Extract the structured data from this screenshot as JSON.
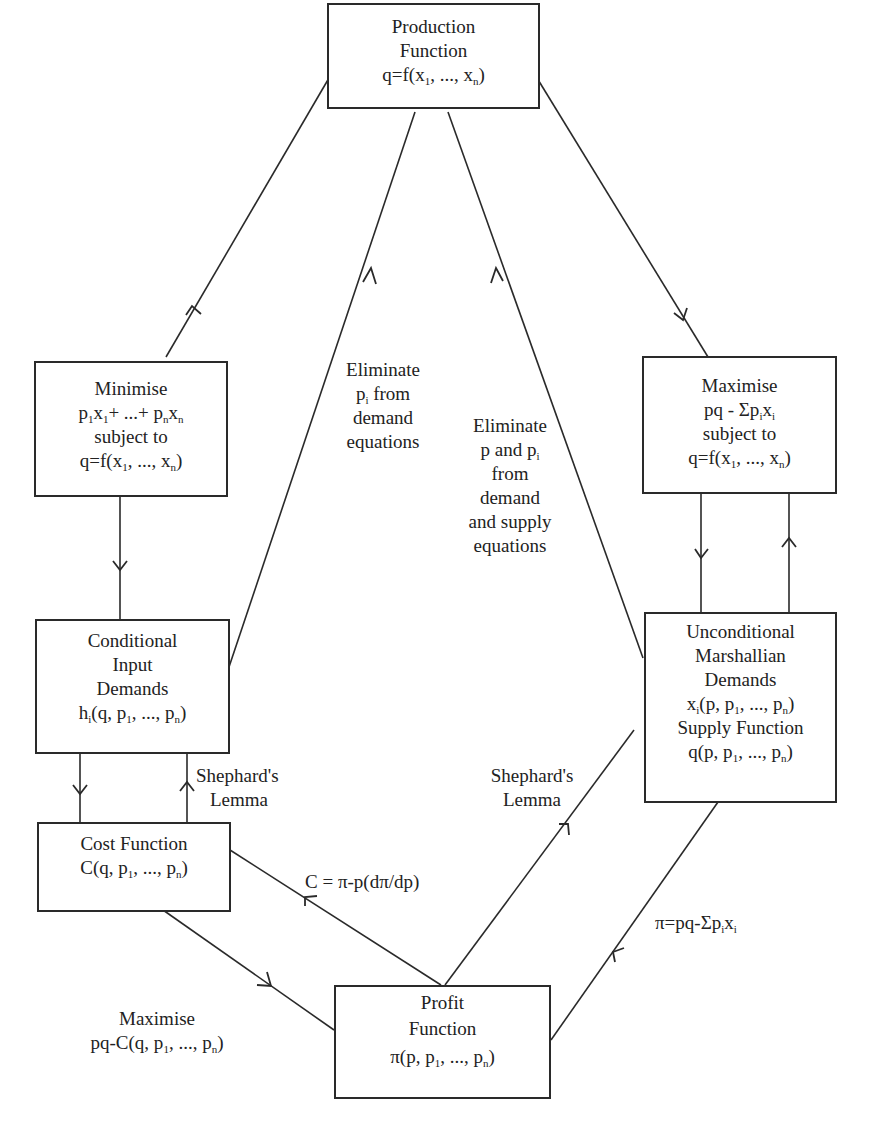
{
  "diagram": {
    "nodes": {
      "production": {
        "lines": [
          "Production",
          "Function",
          "q=f(x1, ..., xn)"
        ]
      },
      "minimise": {
        "lines": [
          "Minimise",
          "p1x1+ ...+ pnxn",
          "subject to",
          "q=f(x1, ..., xn)"
        ]
      },
      "maximise": {
        "lines": [
          "Maximise",
          "pq - Σpixi",
          "subject to",
          "q=f(x1, ..., xn)"
        ]
      },
      "conditional": {
        "lines": [
          "Conditional",
          "Input",
          "Demands",
          "hi(q, p1, ..., pn)"
        ]
      },
      "unconditional": {
        "lines": [
          "Unconditional",
          "Marshallian",
          "Demands",
          "xi(p, p1, ..., pn)",
          "Supply Function",
          "q(p, p1, ..., pn)"
        ]
      },
      "cost": {
        "lines": [
          "Cost Function",
          "C(q, p1, ..., pn)"
        ]
      },
      "profit": {
        "lines": [
          "Profit",
          "Function",
          "π(p, p1, ..., pn)"
        ]
      }
    },
    "edge_labels": {
      "eliminate_pi": [
        "Eliminate",
        "pi from",
        "demand",
        "equations"
      ],
      "eliminate_p_pi": [
        "Eliminate",
        "p and pi",
        "from",
        "demand",
        "and supply",
        "equations"
      ],
      "shephard_left": [
        "Shephard's",
        "Lemma"
      ],
      "shephard_right": [
        "Shephard's",
        "Lemma"
      ],
      "cost_from_profit": "C = π-p(dπ/dp)",
      "profit_identity": "π=pq-Σpixi",
      "maximise_cost": [
        "Maximise",
        "pq-C(q, p1, ..., pn)"
      ]
    },
    "edges": [
      {
        "from": "production",
        "to": "minimise"
      },
      {
        "from": "production",
        "to": "maximise"
      },
      {
        "from": "minimise",
        "to": "conditional"
      },
      {
        "from": "conditional",
        "to": "production",
        "label": "eliminate_pi"
      },
      {
        "from": "unconditional",
        "to": "production",
        "label": "eliminate_p_pi"
      },
      {
        "from": "maximise",
        "to": "unconditional"
      },
      {
        "from": "unconditional",
        "to": "maximise"
      },
      {
        "from": "conditional",
        "to": "cost"
      },
      {
        "from": "cost",
        "to": "conditional",
        "label": "shephard_left"
      },
      {
        "from": "cost",
        "to": "profit",
        "label": "maximise_cost"
      },
      {
        "from": "profit",
        "to": "cost",
        "label": "cost_from_profit"
      },
      {
        "from": "profit",
        "to": "unconditional",
        "label": "shephard_right"
      },
      {
        "from": "unconditional",
        "to": "profit",
        "label": "profit_identity"
      }
    ]
  }
}
